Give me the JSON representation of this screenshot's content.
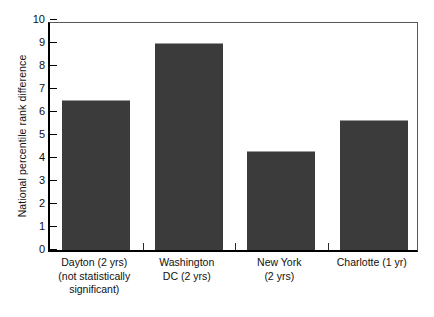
{
  "chart_data": {
    "type": "bar",
    "title": "",
    "xlabel": "",
    "ylabel": "National percentile rank difference",
    "categories": [
      "Dayton (2 yrs)\n(not statistically\nsignificant)",
      "Washington\nDC (2 yrs)",
      "New York\n(2 yrs)",
      "Charlotte (1 yr)"
    ],
    "values": [
      6.5,
      8.95,
      4.28,
      5.6
    ],
    "ylim": [
      0,
      10
    ],
    "yticks": [
      0,
      1,
      2,
      3,
      4,
      5,
      6,
      7,
      8,
      9,
      10
    ],
    "ytick_labels": [
      "0",
      "1",
      "2",
      "3",
      "4",
      "5",
      "6",
      "7",
      "8",
      "9",
      "10"
    ],
    "grid": false,
    "legend": null,
    "bar_color": "#3b3b3b",
    "axis_color": "#000000"
  },
  "axes": {
    "y_title": "National percentile rank difference",
    "y_tick_labels": [
      "10",
      "9",
      "8",
      "7",
      "6",
      "5",
      "4",
      "3",
      "2",
      "1",
      "0"
    ],
    "x_categories": [
      {
        "line1": "Dayton (2 yrs)",
        "line2": "(not statistically",
        "line3": "significant)"
      },
      {
        "line1": "Washington",
        "line2": "DC (2 yrs)",
        "line3": ""
      },
      {
        "line1": "New York",
        "line2": "(2 yrs)",
        "line3": ""
      },
      {
        "line1": "Charlotte (1 yr)",
        "line2": "",
        "line3": ""
      }
    ]
  }
}
